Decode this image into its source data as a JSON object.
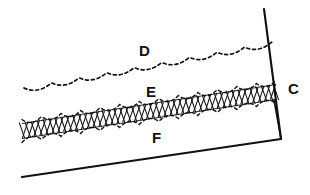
{
  "figure": {
    "kind": "patent-line-drawing",
    "background_color": "#ffffff",
    "ink_color": "#111111",
    "width": 310,
    "height": 195
  },
  "labels": {
    "c": "C",
    "d": "D",
    "e": "E",
    "f": "F"
  },
  "label_positions": {
    "c": {
      "x": 288,
      "y": 94
    },
    "d": {
      "x": 139,
      "y": 56
    },
    "e": {
      "x": 146,
      "y": 97
    },
    "f": {
      "x": 152,
      "y": 143
    }
  },
  "geometry": {
    "baseline": {
      "x1": 22,
      "y1": 177,
      "x2": 281,
      "y2": 139
    },
    "steep_line": {
      "x1": 264,
      "y1": 9,
      "x2": 281,
      "y2": 139
    },
    "band": {
      "left_x": 22,
      "right_x": 276,
      "left_center_y": 131,
      "right_center_y": 92,
      "thickness": 15,
      "hatch_count": 86,
      "scallop_count": 13,
      "scallop_amplitude": 9
    },
    "dashed_curve": {
      "left_x": 24,
      "right_x": 272,
      "left_y": 88,
      "right_y": 42,
      "scallop_count": 9,
      "scallop_amplitude": 9,
      "dash_pattern": "3 3"
    }
  }
}
